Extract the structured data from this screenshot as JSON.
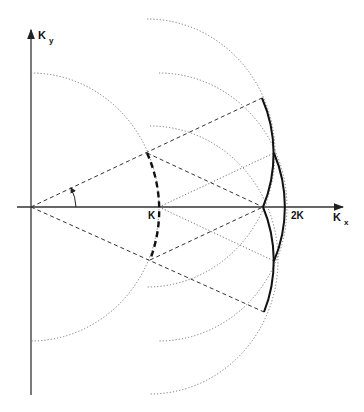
{
  "diagram": {
    "type": "k-space construction",
    "labels": {
      "ky_main": "K",
      "ky_sub": "y",
      "kx_main": "K",
      "kx_sub": "x",
      "k_point": "K",
      "two_k_point": "2K"
    },
    "origin": [
      31,
      207
    ],
    "points": {
      "K": [
        159,
        207
      ],
      "node": [
        263,
        207
      ],
      "2K": [
        287,
        207
      ],
      "P_upper": [
        147,
        153
      ],
      "P_lower": [
        150,
        260
      ]
    },
    "circle_radius_px": 128,
    "colors": {
      "line": "#111111",
      "dotted": "#666666",
      "background": "#ffffff"
    },
    "angle_marker": "theta"
  }
}
